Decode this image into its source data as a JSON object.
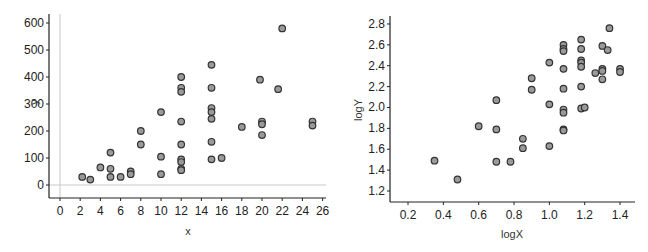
{
  "chart_data": [
    {
      "type": "scatter",
      "title": "",
      "xlabel": "x",
      "ylabel": "y",
      "xlim": [
        -1,
        27
      ],
      "ylim": [
        -50,
        630
      ],
      "xticks": [
        0,
        2,
        4,
        6,
        8,
        10,
        12,
        14,
        16,
        18,
        20,
        22,
        24,
        26
      ],
      "yticks": [
        0,
        100,
        200,
        300,
        400,
        500,
        600
      ],
      "xtick_labels": [
        "0",
        "2",
        "4",
        "6",
        "8",
        "10",
        "12",
        "14",
        "16",
        "18",
        "20",
        "22",
        "24",
        "26"
      ],
      "ytick_labels": [
        "0",
        "100",
        "200",
        "300",
        "400",
        "500",
        "600"
      ],
      "grid": false,
      "reference_lines": {
        "x": 0,
        "y": 0
      },
      "legend": null,
      "marker": {
        "shape": "circle",
        "fill": "#9a9a9a",
        "edge": "#333333"
      },
      "points": [
        [
          2.2,
          30
        ],
        [
          3,
          20
        ],
        [
          4,
          65
        ],
        [
          5,
          120
        ],
        [
          5,
          60
        ],
        [
          5,
          30
        ],
        [
          6,
          30
        ],
        [
          7,
          50
        ],
        [
          7,
          40
        ],
        [
          8,
          200
        ],
        [
          8,
          150
        ],
        [
          10,
          270
        ],
        [
          10,
          105
        ],
        [
          10,
          40
        ],
        [
          12,
          400
        ],
        [
          12,
          360
        ],
        [
          12,
          345
        ],
        [
          12,
          235
        ],
        [
          12,
          150
        ],
        [
          12,
          95
        ],
        [
          12,
          85
        ],
        [
          12,
          60
        ],
        [
          12,
          55
        ],
        [
          15,
          445
        ],
        [
          15,
          360
        ],
        [
          15,
          285
        ],
        [
          15,
          270
        ],
        [
          15,
          245
        ],
        [
          15,
          160
        ],
        [
          15,
          95
        ],
        [
          16,
          100
        ],
        [
          18,
          215
        ],
        [
          19.8,
          390
        ],
        [
          20,
          235
        ],
        [
          20,
          225
        ],
        [
          20,
          185
        ],
        [
          21.6,
          355
        ],
        [
          22,
          580
        ],
        [
          25,
          235
        ],
        [
          25,
          220
        ]
      ]
    },
    {
      "type": "scatter",
      "title": "",
      "xlabel": "logX",
      "ylabel": "logY",
      "xlim": [
        0.1,
        1.5
      ],
      "ylim": [
        1.1,
        2.88
      ],
      "xticks": [
        0.2,
        0.4,
        0.6,
        0.8,
        1.0,
        1.2,
        1.4
      ],
      "yticks": [
        1.2,
        1.4,
        1.6,
        1.8,
        2.0,
        2.2,
        2.4,
        2.6,
        2.8
      ],
      "xtick_labels": [
        "0.2",
        "0.4",
        "0.6",
        "0.8",
        "1.0",
        "1.2",
        "1.4"
      ],
      "ytick_labels": [
        "1.2",
        "1.4",
        "1.6",
        "1.8",
        "2.0",
        "2.2",
        "2.4",
        "2.6",
        "2.8"
      ],
      "grid": false,
      "legend": null,
      "marker": {
        "shape": "circle",
        "fill": "#9a9a9a",
        "edge": "#333333"
      },
      "points": [
        [
          0.35,
          1.49
        ],
        [
          0.48,
          1.31
        ],
        [
          0.6,
          1.82
        ],
        [
          0.7,
          2.07
        ],
        [
          0.7,
          1.79
        ],
        [
          0.7,
          1.48
        ],
        [
          0.78,
          1.48
        ],
        [
          0.85,
          1.7
        ],
        [
          0.85,
          1.61
        ],
        [
          0.9,
          2.28
        ],
        [
          0.9,
          2.17
        ],
        [
          1.0,
          2.43
        ],
        [
          1.0,
          2.03
        ],
        [
          1.0,
          1.63
        ],
        [
          1.08,
          2.6
        ],
        [
          1.08,
          2.56
        ],
        [
          1.08,
          2.54
        ],
        [
          1.08,
          2.37
        ],
        [
          1.08,
          2.18
        ],
        [
          1.08,
          1.98
        ],
        [
          1.08,
          1.95
        ],
        [
          1.08,
          1.79
        ],
        [
          1.08,
          1.78
        ],
        [
          1.18,
          2.65
        ],
        [
          1.18,
          2.56
        ],
        [
          1.18,
          2.45
        ],
        [
          1.18,
          2.43
        ],
        [
          1.18,
          2.39
        ],
        [
          1.18,
          2.2
        ],
        [
          1.18,
          1.99
        ],
        [
          1.2,
          2.0
        ],
        [
          1.26,
          2.33
        ],
        [
          1.3,
          2.59
        ],
        [
          1.3,
          2.37
        ],
        [
          1.3,
          2.35
        ],
        [
          1.3,
          2.27
        ],
        [
          1.33,
          2.55
        ],
        [
          1.34,
          2.76
        ],
        [
          1.4,
          2.37
        ],
        [
          1.4,
          2.34
        ]
      ]
    }
  ]
}
